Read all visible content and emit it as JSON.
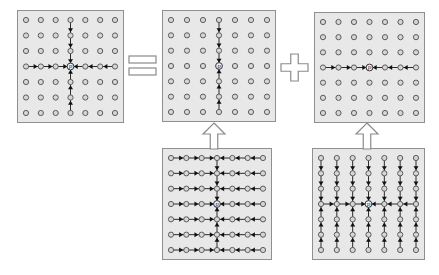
{
  "figure": {
    "canvas": {
      "width": 439,
      "height": 275,
      "background": "#ffffff"
    },
    "theme": {
      "panel_fill": "#e8e8e8",
      "panel_stroke": "#8f8f8f",
      "dot_fill": "#d6d6d6",
      "dot_stroke": "#5c5c5c",
      "line_color": "#2b2b2b",
      "arrow_color": "#111111",
      "center_fill": "#f2f2f2",
      "center_stroke": "#333333",
      "center_text_color": "#222222",
      "operator_stroke": "#8a8a8a",
      "operator_fill": "#ffffff"
    },
    "grid": {
      "rows": 7,
      "cols": 7,
      "center_row": 3,
      "center_col": 3,
      "center_label": "p"
    },
    "panels": [
      {
        "name": "top-left",
        "pattern": "cross-to-center",
        "x": 17,
        "y": 10,
        "w": 107,
        "h": 113
      },
      {
        "name": "top-middle",
        "pattern": "vertical-to-center",
        "x": 162,
        "y": 10,
        "w": 114,
        "h": 112
      },
      {
        "name": "top-right",
        "pattern": "horizontal-to-center",
        "x": 314,
        "y": 12,
        "w": 111,
        "h": 111
      },
      {
        "name": "bottom-left",
        "pattern": "all-rows-horizontal-plus-center-vertical",
        "x": 162,
        "y": 148,
        "w": 110,
        "h": 112
      },
      {
        "name": "bottom-right",
        "pattern": "all-cols-vertical-plus-center-horizontal",
        "x": 312,
        "y": 148,
        "w": 113,
        "h": 112
      }
    ],
    "operators": [
      {
        "type": "equals",
        "symbol": "=",
        "x": 129,
        "y": 56,
        "w": 27,
        "h": 19
      },
      {
        "type": "plus",
        "symbol": "+",
        "x": 280.5,
        "y": 54,
        "w": 27,
        "h": 27
      },
      {
        "type": "up-arrow",
        "symbol": "⇧",
        "x": 203,
        "y": 123,
        "w": 22,
        "h": 26
      },
      {
        "type": "up-arrow",
        "symbol": "⇧",
        "x": 355.5,
        "y": 123,
        "w": 22,
        "h": 26
      }
    ]
  }
}
